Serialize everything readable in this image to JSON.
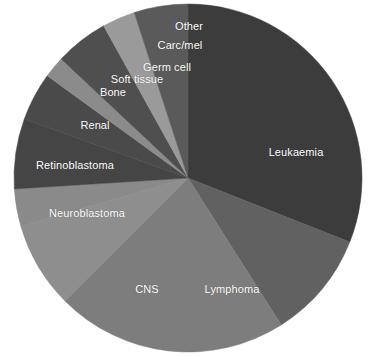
{
  "chart_data": {
    "type": "pie",
    "title": "",
    "subtitle": "",
    "xlabel": "",
    "ylabel": "",
    "legend_position": "none",
    "grid": false,
    "labels_placement": "inside-slices",
    "start_angle_deg": 0,
    "direction": "clockwise",
    "center": {
      "x": 188,
      "y": 178
    },
    "radius": 174,
    "categories": [
      "Leukaemia",
      "Lymphoma",
      "CNS",
      "Neuroblastoma",
      "Retinoblastoma",
      "Renal",
      "Bone",
      "Soft tissue",
      "Germ cell",
      "Carc/mel",
      "Other"
    ],
    "values": [
      31.0,
      10.0,
      21.5,
      8.0,
      3.5,
      6.5,
      4.5,
      6.0,
      3.0,
      2.5,
      3.5
    ],
    "units": "percent",
    "slices": [
      {
        "name": "Leukaemia",
        "value": 31.0,
        "color": "#3c3c3c",
        "start_deg": 0,
        "end_deg": 111.6,
        "label": "Leukaemia",
        "label_x": 296,
        "label_y": 152
      },
      {
        "name": "Lymphoma",
        "value": 10.0,
        "color": "#616161",
        "start_deg": 111.6,
        "end_deg": 147.6,
        "label": "Lymphoma",
        "label_x": 232,
        "label_y": 289
      },
      {
        "name": "CNS",
        "value": 21.5,
        "color": "#7d7d7d",
        "start_deg": 147.6,
        "end_deg": 225.0,
        "label": "CNS",
        "label_x": 147,
        "label_y": 289
      },
      {
        "name": "Neuroblastoma",
        "value": 8.0,
        "color": "#8e8e8e",
        "start_deg": 225.0,
        "end_deg": 253.8,
        "label": "Neuroblastoma",
        "label_x": 87,
        "label_y": 213
      },
      {
        "name": "Retinoblastoma",
        "value": 3.5,
        "color": "#8a8a8a",
        "start_deg": 253.8,
        "end_deg": 266.4,
        "label": "Retinoblastoma",
        "label_x": 75,
        "label_y": 165
      },
      {
        "name": "Renal",
        "value": 6.5,
        "color": "#454545",
        "start_deg": 266.4,
        "end_deg": 289.8,
        "label": "Renal",
        "label_x": 95,
        "label_y": 125
      },
      {
        "name": "Bone",
        "value": 4.5,
        "color": "#4a4a4a",
        "start_deg": 289.8,
        "end_deg": 306.0,
        "label": "Bone",
        "label_x": 113,
        "label_y": 92
      },
      {
        "name": "Soft tissue",
        "value": 6.0,
        "color": "#8b8b8b",
        "start_deg": 306.0,
        "end_deg": 313.2,
        "label": "Soft tissue",
        "label_x": 137,
        "label_y": 79
      },
      {
        "name": "Germ cell",
        "value": 3.0,
        "color": "#4f4f4f",
        "start_deg": 313.2,
        "end_deg": 331.0,
        "label": "Germ cell",
        "label_x": 167,
        "label_y": 67
      },
      {
        "name": "Carc/mel",
        "value": 2.5,
        "color": "#9a9a9a",
        "start_deg": 331.0,
        "end_deg": 342.0,
        "label": "Carc/mel",
        "label_x": 180,
        "label_y": 45
      },
      {
        "name": "Other",
        "value": 3.5,
        "color": "#5a5a5a",
        "start_deg": 342.0,
        "end_deg": 360.0,
        "label": "Other",
        "label_x": 189,
        "label_y": 26
      }
    ],
    "background_color": "#ffffff",
    "label_color": "#ffffff"
  }
}
